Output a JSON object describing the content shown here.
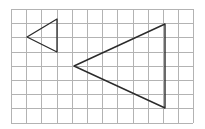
{
  "figure": {
    "canvas": {
      "width": 205,
      "height": 129,
      "background": "#ffffff"
    },
    "grid": {
      "origin_x": 11,
      "origin_y": 9,
      "cols": 12,
      "rows": 8,
      "cell_width": 15.2,
      "cell_height": 14.2,
      "line_color": "#b3b3b3",
      "border_color": "#b3b3b3",
      "visible": true
    },
    "shapes": [
      {
        "name": "small-triangle",
        "label": "small triangle",
        "type": "triangle",
        "orientation": "points-left",
        "stroke_color": "#2b2b2b",
        "stroke_width": 1.3,
        "fill": "none",
        "points": "27,37 57,19 57,52",
        "vertices": [
          {
            "name": "apex-left",
            "x": 27,
            "y": 37
          },
          {
            "name": "top-right",
            "x": 57,
            "y": 19
          },
          {
            "name": "bottom-right",
            "x": 57,
            "y": 52
          }
        ]
      },
      {
        "name": "large-triangle",
        "label": "large triangle",
        "type": "triangle",
        "orientation": "points-left",
        "stroke_color": "#2b2b2b",
        "stroke_width": 1.4,
        "fill": "none",
        "points": "74,66 165,24 165,108",
        "vertices": [
          {
            "name": "apex-left",
            "x": 74,
            "y": 66
          },
          {
            "name": "top-right",
            "x": 165,
            "y": 24
          },
          {
            "name": "bottom-right",
            "x": 165,
            "y": 108
          }
        ]
      }
    ]
  }
}
